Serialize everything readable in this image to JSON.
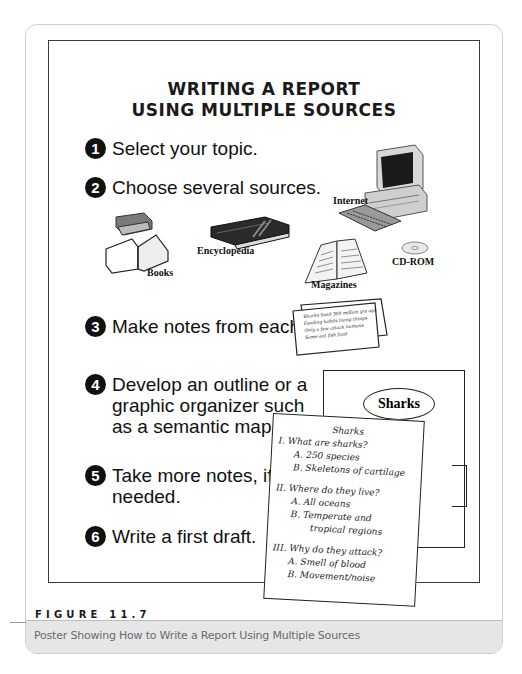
{
  "poster": {
    "title_line1": "WRITING A REPORT",
    "title_line2": "USING MULTIPLE SOURCES",
    "steps": [
      {
        "number": "1",
        "text": "Select your topic."
      },
      {
        "number": "2",
        "text": "Choose several sources."
      },
      {
        "number": "3",
        "text": "Make notes from each."
      },
      {
        "number": "4",
        "text": "Develop an outline or a\ngraphic organizer such\nas a semantic map."
      },
      {
        "number": "5",
        "text": "Take more notes, if\nneeded."
      },
      {
        "number": "6",
        "text": "Write a first draft."
      }
    ],
    "sources": [
      {
        "label": "Internet",
        "icon": "computer-icon"
      },
      {
        "label": "Books",
        "icon": "books-icon"
      },
      {
        "label": "Encyclopedia",
        "icon": "encyclopedia-icon"
      },
      {
        "label": "Magazines",
        "icon": "magazine-icon"
      },
      {
        "label": "CD-ROM",
        "icon": "cd-rom-icon"
      }
    ],
    "notecard_lines": [
      "Sharks lived 300 million yrs ago",
      "Feeding habits living things",
      "Only a few attack humans",
      "Some eat fish food"
    ],
    "semantic_map": {
      "center": "Sharks"
    },
    "outline": {
      "title": "Sharks",
      "lines": [
        {
          "indent": 0,
          "text": "I.  What are sharks?"
        },
        {
          "indent": 1,
          "text": "A.  250 species"
        },
        {
          "indent": 1,
          "text": "B.  Skeletons of cartilage"
        },
        {
          "indent": 0,
          "text": "II.  Where do they live?"
        },
        {
          "indent": 1,
          "text": "A.  All oceans"
        },
        {
          "indent": 1,
          "text": "B.  Temperate and"
        },
        {
          "indent": 2,
          "text": "tropical regions"
        },
        {
          "indent": 0,
          "text": "III.  Why do they attack?"
        },
        {
          "indent": 1,
          "text": "A.  Smell of blood"
        },
        {
          "indent": 1,
          "text": "B.  Movement/noise"
        }
      ]
    }
  },
  "figure": {
    "label": "FIGURE 11.7",
    "caption": "Poster Showing How to Write a Report Using Multiple Sources"
  }
}
